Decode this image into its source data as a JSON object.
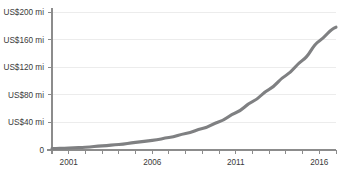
{
  "chart_data": {
    "type": "line",
    "title": "",
    "subtitle": "",
    "xlabel": "",
    "ylabel": "",
    "grid": true,
    "legend": false,
    "legend_position": "none",
    "line_color": "#7f8082",
    "grid_color": "#ececec",
    "axis_color": "#8c8c8c",
    "text_color": "#3a3a3a",
    "background_color": "#ffffff",
    "xlim": [
      2000,
      2017
    ],
    "ylim": [
      0,
      200
    ],
    "y_tick_values": [
      0,
      40,
      80,
      120,
      160,
      200
    ],
    "y_tick_labels": [
      "0",
      "US$40 mi",
      "US$80 mi",
      "US$120 mi",
      "US$160 mi",
      "US$200 mi"
    ],
    "x_tick_values": [
      2000,
      2001,
      2002,
      2003,
      2004,
      2005,
      2006,
      2007,
      2008,
      2009,
      2010,
      2011,
      2012,
      2013,
      2014,
      2015,
      2016,
      2017
    ],
    "x_tick_labels_shown": [
      "2001",
      "2006",
      "2011",
      "2016"
    ],
    "x_labeled_values": [
      2001,
      2006,
      2011,
      2016
    ],
    "x": [
      2000,
      2001,
      2002,
      2003,
      2004,
      2005,
      2006,
      2007,
      2008,
      2009,
      2010,
      2011,
      2012,
      2013,
      2014,
      2015,
      2016,
      2017
    ],
    "values": [
      2,
      3,
      4,
      6,
      8,
      11,
      14,
      18,
      24,
      31,
      41,
      54,
      70,
      88,
      108,
      130,
      158,
      178
    ],
    "series": [
      {
        "name": "Revenue",
        "values": [
          2,
          3,
          4,
          6,
          8,
          11,
          14,
          18,
          24,
          31,
          41,
          54,
          70,
          88,
          108,
          130,
          158,
          178
        ]
      }
    ],
    "units": "US$ millions",
    "annotations": []
  },
  "axes": {
    "y_labels": [
      {
        "value": 200,
        "text": "US$200 mi"
      },
      {
        "value": 160,
        "text": "US$160 mi"
      },
      {
        "value": 120,
        "text": "US$120 mi"
      },
      {
        "value": 80,
        "text": "US$80 mi"
      },
      {
        "value": 40,
        "text": "US$40 mi"
      },
      {
        "value": 0,
        "text": "0"
      }
    ],
    "x_labels": [
      {
        "value": 2001,
        "text": "2001"
      },
      {
        "value": 2006,
        "text": "2006"
      },
      {
        "value": 2011,
        "text": "2011"
      },
      {
        "value": 2016,
        "text": "2016"
      }
    ]
  }
}
